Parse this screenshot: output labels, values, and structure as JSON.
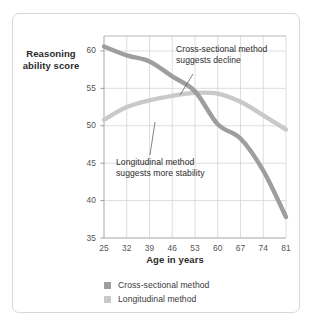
{
  "chart_data": {
    "type": "line",
    "title": "",
    "xlabel": "Age in years",
    "ylabel": "Reasoning ability score",
    "x": [
      25,
      32,
      39,
      46,
      53,
      60,
      67,
      74,
      81
    ],
    "xlim": [
      25,
      81
    ],
    "ylim": [
      35,
      62
    ],
    "y_ticks": [
      35,
      40,
      45,
      50,
      55,
      60
    ],
    "x_ticks": [
      25,
      32,
      39,
      46,
      53,
      60,
      67,
      74,
      81
    ],
    "grid": true,
    "legend_position": "bottom",
    "series": [
      {
        "name": "Cross-sectional method",
        "color": "#9e9e9e",
        "values": [
          60.6,
          59.4,
          58.6,
          56.6,
          54.6,
          50.2,
          48.3,
          44.0,
          37.8
        ]
      },
      {
        "name": "Longitudinal method",
        "color": "#c9c9c9",
        "values": [
          50.8,
          52.5,
          53.4,
          54.0,
          54.4,
          54.3,
          53.2,
          51.4,
          49.5
        ]
      }
    ],
    "annotations": [
      {
        "id": "cross-sectional-callout",
        "line1": "Cross-sectional method",
        "line2": "suggests decline"
      },
      {
        "id": "longitudinal-callout",
        "line1": "Longitudinal method",
        "line2": "suggests more stability"
      }
    ]
  },
  "axes": {
    "y_title_line1": "Reasoning",
    "y_title_line2": "ability score",
    "x_title": "Age in years"
  },
  "legend": {
    "items": [
      {
        "label": "Cross-sectional method",
        "color": "#9e9e9e"
      },
      {
        "label": "Longitudinal method",
        "color": "#c9c9c9"
      }
    ]
  },
  "colors": {
    "cross_sectional": "#9e9e9e",
    "longitudinal": "#c9c9c9",
    "grid": "#d5d5d5",
    "card_border": "#d8d8d8",
    "text": "#2b2b2b",
    "tick_text": "#555555"
  }
}
